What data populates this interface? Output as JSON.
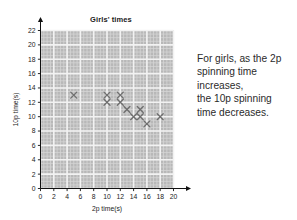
{
  "chart_data": {
    "type": "scatter",
    "title": "Girls' times",
    "xlabel": "2p time(s)",
    "ylabel": "10p time(s)",
    "xlim": [
      0,
      20
    ],
    "ylim": [
      0,
      22
    ],
    "xticks": [
      0,
      2,
      4,
      6,
      8,
      10,
      12,
      14,
      16,
      18,
      20
    ],
    "yticks": [
      0,
      2,
      4,
      6,
      8,
      10,
      12,
      14,
      16,
      18,
      20,
      22
    ],
    "grid": true,
    "grid_major_step": 2,
    "grid_minor_step": 0.5,
    "legend": null,
    "marker": "x",
    "marker_color": "#6e6e6e",
    "plot_bg": "#b8b8b8",
    "gridline_color": "#f2f2f2",
    "points": [
      {
        "x": 5,
        "y": 13
      },
      {
        "x": 10,
        "y": 13
      },
      {
        "x": 10,
        "y": 12
      },
      {
        "x": 12,
        "y": 13
      },
      {
        "x": 12,
        "y": 12
      },
      {
        "x": 13,
        "y": 11
      },
      {
        "x": 14,
        "y": 10
      },
      {
        "x": 15,
        "y": 11
      },
      {
        "x": 15,
        "y": 10
      },
      {
        "x": 16,
        "y": 9
      },
      {
        "x": 18,
        "y": 10
      }
    ]
  },
  "annotation": {
    "lines": [
      "For girls, as the 2p",
      "spinning time",
      "increases,",
      "the 10p spinning",
      "time decreases."
    ]
  }
}
